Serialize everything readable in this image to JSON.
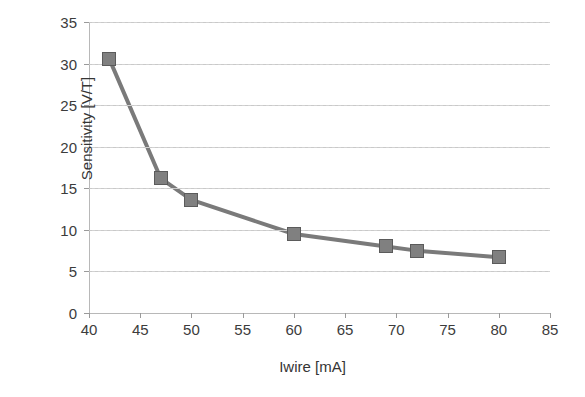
{
  "chart_data": {
    "type": "line",
    "title": "",
    "subtitle": "",
    "xlabel": "Iwire [mA]",
    "ylabel": "Sensitivity [V/T]",
    "x": [
      42,
      47,
      50,
      60,
      69,
      72,
      80
    ],
    "values": [
      30.5,
      16.2,
      13.6,
      9.5,
      8.0,
      7.5,
      6.7
    ],
    "series": [
      {
        "name": "Sensitivity",
        "x": [
          42,
          47,
          50,
          60,
          69,
          72,
          80
        ],
        "values": [
          30.5,
          16.2,
          13.6,
          9.5,
          8.0,
          7.5,
          6.7
        ]
      }
    ],
    "xlim": [
      40,
      85
    ],
    "ylim": [
      0,
      35
    ],
    "xticks": [
      40,
      45,
      50,
      55,
      60,
      65,
      70,
      75,
      80,
      85
    ],
    "yticks": [
      0,
      5,
      10,
      15,
      20,
      25,
      30,
      35
    ],
    "xtick_labels": [
      "40",
      "45",
      "50",
      "55",
      "60",
      "65",
      "70",
      "75",
      "80",
      "85"
    ],
    "ytick_labels": [
      "0",
      "5",
      "10",
      "15",
      "20",
      "25",
      "30",
      "35"
    ],
    "grid": "horizontal-dashed",
    "legend": "none",
    "annotations": [],
    "marker": {
      "shape": "square",
      "fill_color": "#808080",
      "edge_color": "#5b5b5b"
    },
    "line": {
      "color": "#7a7a7a",
      "width": 4,
      "style": "solid"
    },
    "background_color": "#ffffff",
    "axis_color": "#b8b8b8",
    "gridline_color": "#c9c9c9",
    "text_color": "#3c3c3c"
  }
}
